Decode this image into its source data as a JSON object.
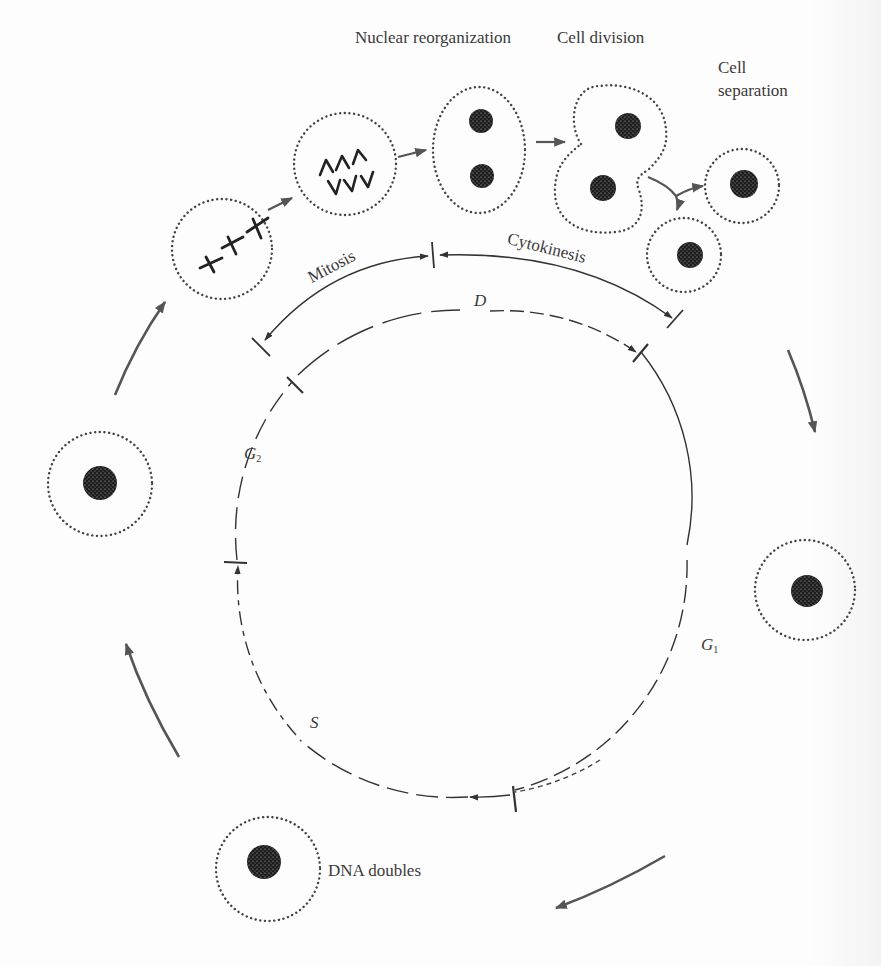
{
  "diagram": {
    "type": "cell-cycle",
    "labels": {
      "nuclear_reorganization": "Nuclear reorganization",
      "cell_division": "Cell division",
      "cell_separation_line1": "Cell",
      "cell_separation_line2": "separation",
      "mitosis": "Mitosis",
      "cytokinesis": "Cytokinesis",
      "phase_d": "D",
      "phase_g1": "G",
      "phase_g1_sub": "1",
      "phase_g2": "G",
      "phase_g2_sub": "2",
      "phase_s": "S",
      "dna_doubles": "DNA doubles"
    },
    "phases": [
      {
        "id": "D",
        "name": "Division",
        "substages": [
          "Mitosis",
          "Cytokinesis"
        ]
      },
      {
        "id": "G1",
        "name": "Gap 1"
      },
      {
        "id": "S",
        "name": "Synthesis",
        "note": "DNA doubles"
      },
      {
        "id": "G2",
        "name": "Gap 2"
      }
    ],
    "cell_stages": [
      "Chromosomes aligned (metaphase)",
      "Chromosomes separating (anaphase)",
      "Nuclear reorganization",
      "Cell division",
      "Cell separation",
      "Interphase cell (G1)",
      "DNA doubles (S)",
      "Interphase cell (G2)"
    ],
    "colors": {
      "ink": "#333333",
      "arrow": "#555555",
      "nucleus": "#1e1e1e",
      "background": "#fdfdfd"
    }
  }
}
